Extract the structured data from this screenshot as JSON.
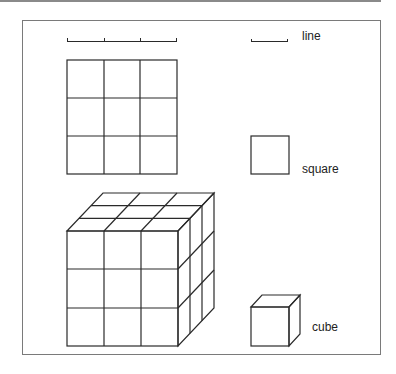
{
  "labels": {
    "line": "line",
    "square": "square",
    "cube": "cube"
  },
  "colors": {
    "stroke": "#2a2a2a",
    "frame": "#7a7a7a",
    "topbar": "#8a8a8a"
  },
  "figure": {
    "ruler_segments": 3,
    "grid_rows": 3,
    "grid_cols": 3,
    "cube_layers": 3
  }
}
